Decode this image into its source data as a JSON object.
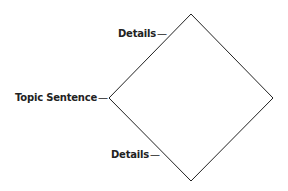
{
  "diagram": {
    "shape": "diamond",
    "stroke_color": "#222222",
    "vertices": {
      "top": [
        191,
        14
      ],
      "left": [
        109,
        98
      ],
      "right": [
        273,
        98
      ],
      "bottom": [
        191,
        181
      ]
    },
    "labels": {
      "top_details": "Details",
      "topic_sentence": "Topic Sentence",
      "bottom_details": "Details",
      "dash": "—"
    }
  }
}
